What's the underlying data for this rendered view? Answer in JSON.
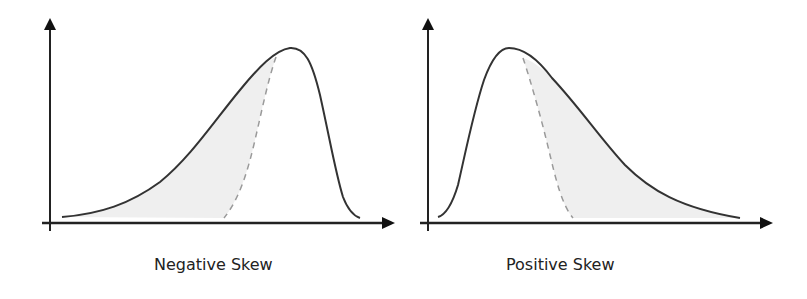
{
  "diagram": {
    "panels": [
      {
        "id": "negative",
        "label": "Negative Skew",
        "description": "Left-skewed distribution: long tail to the left, peak to the right; shaded region between curve and dashed normal reference on the left side"
      },
      {
        "id": "positive",
        "label": "Positive Skew",
        "description": "Right-skewed distribution: peak to the left, long tail to the right; shaded region between dashed normal reference and curve on the right side"
      }
    ],
    "colors": {
      "curve": "#333333",
      "axis": "#222222",
      "dashed": "#9a9a9a",
      "fill": "#efefef"
    },
    "icons": {
      "axis_arrow": "arrowhead"
    }
  }
}
